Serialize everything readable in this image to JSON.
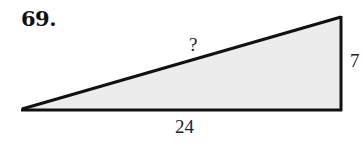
{
  "problem": {
    "number": "69."
  },
  "triangle": {
    "hypotenuse_label": "?",
    "vertical_side_label": "7",
    "base_label": "24",
    "fill_color": "#ececec",
    "stroke_color": "#111111"
  }
}
